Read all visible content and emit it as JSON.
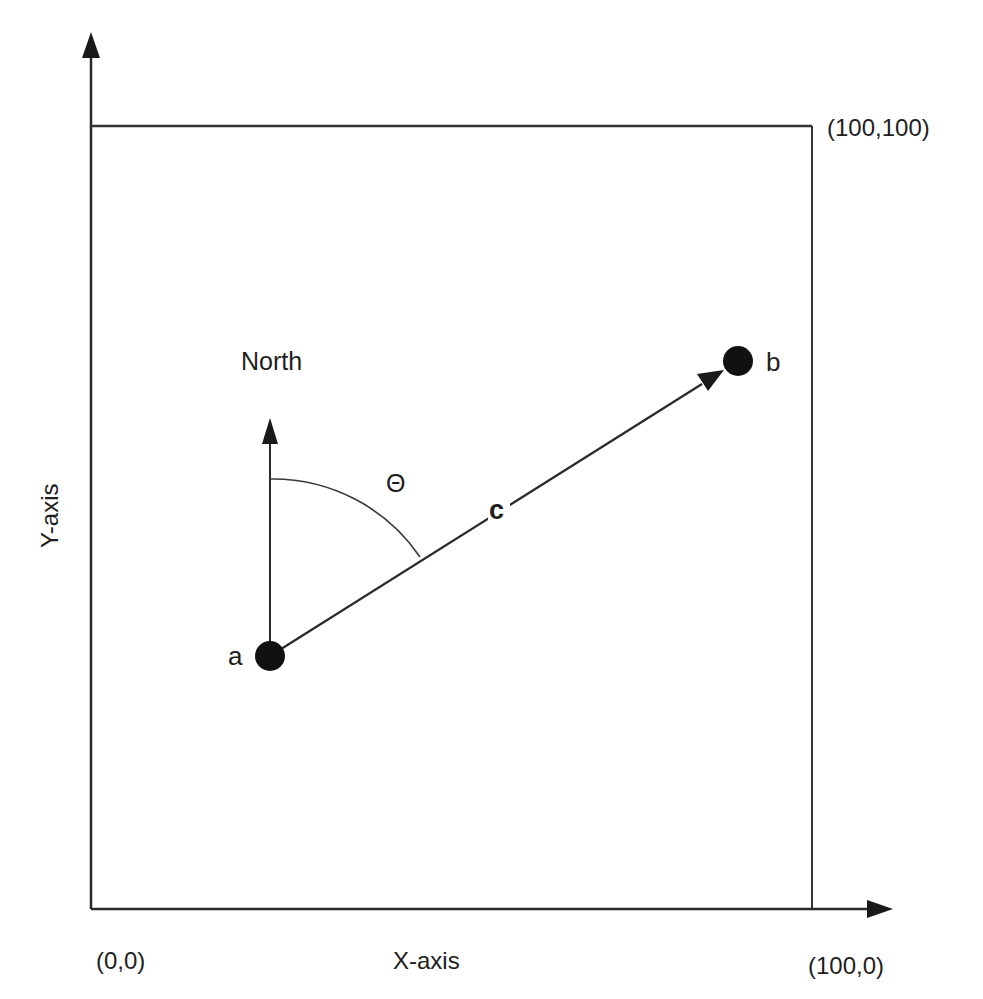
{
  "diagram": {
    "title": "",
    "axes": {
      "x_label": "X-axis",
      "y_label": "Y-axis",
      "origin_label": "(0,0)",
      "x_max_label": "(100,0)",
      "corner_label": "(100,100)"
    },
    "reference": {
      "north_label": "North",
      "angle_label": "Θ",
      "vector_label": "c"
    },
    "points": [
      {
        "id": "a",
        "label": "a"
      },
      {
        "id": "b",
        "label": "b"
      }
    ],
    "edges": [
      {
        "from": "a",
        "to": "b",
        "label": "c",
        "directed": true
      },
      {
        "from": "a",
        "to": "north",
        "label": "North",
        "directed": true
      }
    ],
    "angle": {
      "between": [
        "North",
        "c"
      ],
      "label": "Θ"
    },
    "colors": {
      "line": "#2a2a2a",
      "point": "#111111",
      "text": "#1e1e1e",
      "background": "#ffffff"
    }
  }
}
